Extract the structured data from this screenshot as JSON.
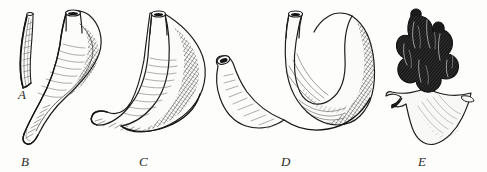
{
  "plate": {
    "kind": "engraved-line-art-specimen-plate",
    "background_color": "#fdfdfb",
    "ink_color": "#1d1d1d",
    "width": 487,
    "height": 172,
    "figure_count": 5
  },
  "labels": {
    "a": "A",
    "b": "B",
    "c": "C",
    "d": "D",
    "e": "E"
  },
  "figures": [
    {
      "id": "a",
      "label": "A",
      "description": "slender slightly curved tube, smallest specimen",
      "label_position": {
        "x": 18,
        "y": 88
      },
      "bounds": {
        "x": 16,
        "y": 12,
        "width": 24,
        "height": 78
      }
    },
    {
      "id": "b",
      "label": "B",
      "description": "horn shaped form with narrow upright neck, swollen body and long tapering tail curving to lower left",
      "label_position": {
        "x": 21,
        "y": 155
      },
      "bounds": {
        "x": 26,
        "y": 10,
        "width": 88,
        "height": 135
      }
    },
    {
      "id": "c",
      "label": "C",
      "description": "hook or J shaped form, open tube aperture at top widening into a broad curved body",
      "label_position": {
        "x": 139,
        "y": 155
      },
      "bounds": {
        "x": 90,
        "y": 10,
        "width": 118,
        "height": 135
      }
    },
    {
      "id": "d",
      "label": "D",
      "description": "large crescent or U shaped form with two openings at the top and a broad swollen base",
      "label_position": {
        "x": 281,
        "y": 155
      },
      "bounds": {
        "x": 205,
        "y": 10,
        "width": 150,
        "height": 138
      }
    },
    {
      "id": "e",
      "label": "E",
      "description": "dark lumpy cluster of stout lobes rising from a pale irregular basal sheet, heavily shaded",
      "label_position": {
        "x": 418,
        "y": 155
      },
      "bounds": {
        "x": 382,
        "y": 8,
        "width": 100,
        "height": 138
      }
    }
  ]
}
